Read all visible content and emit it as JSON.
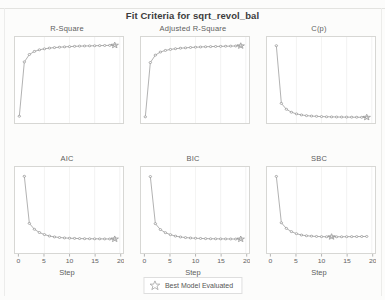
{
  "title": "Fit Criteria for sqrt_revol_bal",
  "axis": {
    "xlabel": "Step",
    "ticks": [
      "0",
      "5",
      "10",
      "15",
      "20"
    ]
  },
  "legend": {
    "label": "Best Model Evaluated",
    "icon": "star-icon"
  },
  "panels": [
    {
      "name": "r-square",
      "title": "R-Square"
    },
    {
      "name": "adjusted-r-square",
      "title": "Adjusted R-Square"
    },
    {
      "name": "cp",
      "title": "C(p)"
    },
    {
      "name": "aic",
      "title": "AIC"
    },
    {
      "name": "bic",
      "title": "BIC"
    },
    {
      "name": "sbc",
      "title": "SBC"
    }
  ],
  "chart_data": [
    {
      "type": "line",
      "title": "R-Square",
      "xlabel": "Step",
      "ylabel": "",
      "xlim": [
        0,
        20
      ],
      "ylim": [
        0.0,
        0.62
      ],
      "xticks": [
        0,
        5,
        10,
        15,
        20
      ],
      "grid": true,
      "marker": "open-circle",
      "best_model_step": 19,
      "x": [
        0,
        1,
        2,
        3,
        4,
        5,
        6,
        7,
        8,
        9,
        10,
        11,
        12,
        13,
        14,
        15,
        16,
        17,
        18,
        19
      ],
      "values": [
        0.02,
        0.46,
        0.52,
        0.545,
        0.558,
        0.566,
        0.572,
        0.576,
        0.579,
        0.582,
        0.584,
        0.586,
        0.588,
        0.589,
        0.59,
        0.591,
        0.592,
        0.593,
        0.594,
        0.595
      ]
    },
    {
      "type": "line",
      "title": "Adjusted R-Square",
      "xlabel": "Step",
      "ylabel": "",
      "xlim": [
        0,
        20
      ],
      "ylim": [
        0.0,
        0.62
      ],
      "xticks": [
        0,
        5,
        10,
        15,
        20
      ],
      "grid": true,
      "marker": "open-circle",
      "best_model_step": 19,
      "x": [
        0,
        1,
        2,
        3,
        4,
        5,
        6,
        7,
        8,
        9,
        10,
        11,
        12,
        13,
        14,
        15,
        16,
        17,
        18,
        19
      ],
      "values": [
        0.015,
        0.455,
        0.515,
        0.54,
        0.553,
        0.561,
        0.567,
        0.571,
        0.574,
        0.577,
        0.579,
        0.581,
        0.583,
        0.584,
        0.585,
        0.586,
        0.587,
        0.588,
        0.589,
        0.59
      ]
    },
    {
      "type": "line",
      "title": "C(p)",
      "xlabel": "Step",
      "ylabel": "",
      "xlim": [
        0,
        20
      ],
      "ylim": [
        0,
        1300
      ],
      "xticks": [
        0,
        5,
        10,
        15,
        20
      ],
      "grid": true,
      "marker": "open-circle",
      "best_model_step": 19,
      "x": [
        1,
        2,
        3,
        4,
        5,
        6,
        7,
        8,
        9,
        10,
        11,
        12,
        13,
        14,
        15,
        16,
        17,
        18,
        19
      ],
      "values": [
        1240,
        260,
        160,
        110,
        82,
        64,
        52,
        45,
        40,
        36,
        33,
        31,
        29,
        28,
        27,
        26,
        25,
        24,
        23
      ]
    },
    {
      "type": "line",
      "title": "AIC",
      "xlabel": "Step",
      "ylabel": "",
      "xlim": [
        0,
        20
      ],
      "ylim": [
        0,
        1300
      ],
      "xticks": [
        0,
        5,
        10,
        15,
        20
      ],
      "grid": true,
      "marker": "open-circle",
      "best_model_step": 19,
      "x": [
        1,
        2,
        3,
        4,
        5,
        6,
        7,
        8,
        9,
        10,
        11,
        12,
        13,
        14,
        15,
        16,
        17,
        18,
        19
      ],
      "values": [
        1230,
        430,
        330,
        275,
        240,
        215,
        200,
        190,
        183,
        178,
        175,
        172,
        170,
        169,
        168,
        167,
        166,
        165,
        164
      ]
    },
    {
      "type": "line",
      "title": "BIC",
      "xlabel": "Step",
      "ylabel": "",
      "xlim": [
        0,
        20
      ],
      "ylim": [
        0,
        1300
      ],
      "xticks": [
        0,
        5,
        10,
        15,
        20
      ],
      "grid": true,
      "marker": "open-circle",
      "best_model_step": 19,
      "x": [
        1,
        2,
        3,
        4,
        5,
        6,
        7,
        8,
        9,
        10,
        11,
        12,
        13,
        14,
        15,
        16,
        17,
        18,
        19
      ],
      "values": [
        1225,
        425,
        325,
        272,
        238,
        214,
        199,
        189,
        182,
        177,
        174,
        171,
        169,
        168,
        167,
        166,
        165,
        164,
        163
      ]
    },
    {
      "type": "line",
      "title": "SBC",
      "xlabel": "Step",
      "ylabel": "",
      "xlim": [
        0,
        20
      ],
      "ylim": [
        0,
        1300
      ],
      "xticks": [
        0,
        5,
        10,
        15,
        20
      ],
      "grid": true,
      "marker": "open-circle",
      "best_model_step": 12,
      "x": [
        1,
        2,
        3,
        4,
        5,
        6,
        7,
        8,
        9,
        10,
        11,
        12,
        13,
        14,
        15,
        16,
        17,
        18,
        19
      ],
      "values": [
        1228,
        440,
        345,
        290,
        255,
        232,
        220,
        213,
        208,
        205,
        203,
        202,
        202,
        203,
        204,
        205,
        206,
        207,
        208
      ]
    }
  ]
}
